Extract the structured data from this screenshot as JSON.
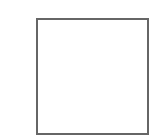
{
  "shape": {
    "type": "square-outline",
    "stroke_color": "#666666",
    "fill_color": "#ffffff"
  }
}
